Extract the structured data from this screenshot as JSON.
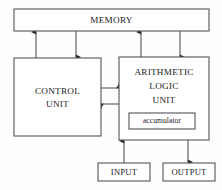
{
  "diagram": {
    "colors": {
      "background": "#fefefe",
      "box_fill": "#ffffff",
      "stroke": "#54545a",
      "text": "#1b1b1f"
    },
    "blocks": {
      "memory": {
        "label": "MEMORY"
      },
      "control_unit": {
        "label_line1": "CONTROL",
        "label_line2": "UNIT"
      },
      "alu": {
        "label_line1": "ARITHMETIC",
        "label_line2": "LOGIC",
        "label_line3": "UNIT"
      },
      "accumulator": {
        "label": "accumulator"
      },
      "input": {
        "label": "INPUT"
      },
      "output": {
        "label": "OUTPUT"
      }
    },
    "connections": [
      {
        "name": "control-unit-to-memory",
        "from": "CONTROL UNIT",
        "to": "MEMORY",
        "direction": "up"
      },
      {
        "name": "memory-to-control-unit",
        "from": "MEMORY",
        "to": "CONTROL UNIT",
        "direction": "down"
      },
      {
        "name": "alu-to-memory",
        "from": "ARITHMETIC LOGIC UNIT",
        "to": "MEMORY",
        "direction": "up"
      },
      {
        "name": "memory-to-alu",
        "from": "MEMORY",
        "to": "ARITHMETIC LOGIC UNIT",
        "direction": "down"
      },
      {
        "name": "control-unit-to-alu",
        "from": "CONTROL UNIT",
        "to": "ARITHMETIC LOGIC UNIT",
        "direction": "right"
      },
      {
        "name": "alu-to-control-unit",
        "from": "ARITHMETIC LOGIC UNIT",
        "to": "CONTROL UNIT",
        "direction": "left"
      },
      {
        "name": "input-to-alu",
        "from": "INPUT",
        "to": "ARITHMETIC LOGIC UNIT",
        "direction": "up"
      },
      {
        "name": "alu-to-output",
        "from": "ARITHMETIC LOGIC UNIT",
        "to": "OUTPUT",
        "direction": "down"
      }
    ]
  }
}
